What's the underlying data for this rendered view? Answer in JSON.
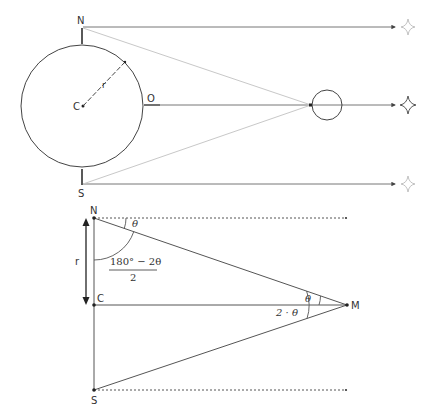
{
  "figure": {
    "top_diagram": {
      "labels": {
        "north": "N",
        "south": "S",
        "center": "C",
        "observer": "O",
        "radius": "r"
      },
      "stars": [
        "star-north",
        "star-center",
        "star-south"
      ]
    },
    "bottom_diagram": {
      "labels": {
        "north": "N",
        "center": "C",
        "south": "S",
        "moon": "M",
        "radius": "r",
        "angle_theta_top": "θ",
        "angle_fraction_numerator": "180° − 2θ",
        "angle_fraction_denominator": "2",
        "angle_theta_at_m": "θ",
        "angle_two_theta": "2 · θ"
      }
    }
  },
  "colors": {
    "line": "#444444",
    "faint_line": "#c8c8c8",
    "star_faint": "#bbbbbb",
    "star_dark": "#555555"
  }
}
